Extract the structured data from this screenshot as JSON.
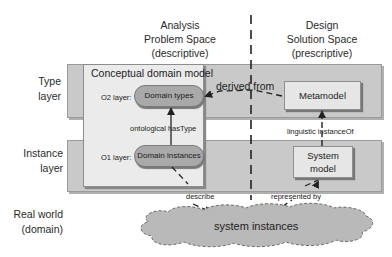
{
  "columns": {
    "analysis": {
      "line1": "Analysis",
      "line2": "Problem Space",
      "line3": "(descriptive)"
    },
    "design": {
      "line1": "Design",
      "line2": "Solution Space",
      "line3": "(prescriptive)"
    }
  },
  "rows": {
    "type_layer": {
      "line1": "Type",
      "line2": "layer"
    },
    "instance_layer": {
      "line1": "Instance",
      "line2": "layer"
    },
    "real_world": {
      "line1": "Real world",
      "line2": "(domain)"
    }
  },
  "conceptual_domain_model": {
    "title": "Conceptual domain model",
    "o2_label": "O2 layer:",
    "o1_label": "O1 layer:",
    "domain_types": "Domain types",
    "domain_instances": "Domain instances",
    "has_type_label": "ontological hasType"
  },
  "design_side": {
    "metamodel": "Metamodel",
    "system_model_line1": "System",
    "system_model_line2": "model",
    "instance_of_label": "linguistic instanceOf"
  },
  "relations": {
    "derived_from": "derived from",
    "describe": "describe",
    "represented_by": "represented by"
  },
  "real_world": {
    "cloud_label": "system instances"
  },
  "colors": {
    "band_fill": "#c9c9c9",
    "model_fill": "#ebebeb",
    "pill_fill": "#a9a9a9",
    "box_fill": "#e6e6e6",
    "cloud_fill": "#b9b9b9",
    "line": "#222222"
  }
}
